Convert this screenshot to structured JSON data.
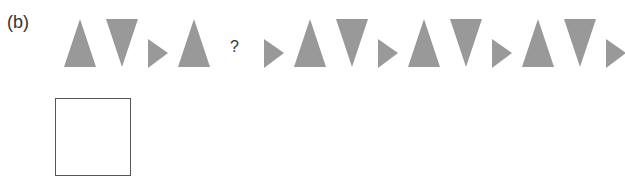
{
  "problem": {
    "label": "(b)",
    "question_mark": "?",
    "shape_color": "#999999",
    "before_gap": [
      "triangle-up",
      "triangle-down",
      "triangle-right",
      "triangle-up"
    ],
    "after_gap": [
      "triangle-right",
      "triangle-up",
      "triangle-down",
      "triangle-right",
      "triangle-up",
      "triangle-down",
      "triangle-right",
      "triangle-up",
      "triangle-down",
      "triangle-right"
    ]
  },
  "answer_box": {
    "value": ""
  }
}
